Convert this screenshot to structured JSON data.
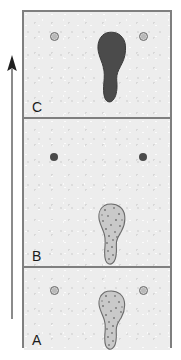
{
  "figure": {
    "background_color": "#ffffff",
    "plate_fill": "#ededed",
    "frame_color": "#7f7f7f",
    "width": 181,
    "height": 360
  },
  "arrow": {
    "name": "direction-arrow",
    "direction": "up",
    "color": "#4d4d4d",
    "label": ""
  },
  "panels": [
    {
      "id": "C",
      "label": "C",
      "order": 3,
      "position": "top",
      "marks": [
        {
          "type": "ring-spot",
          "label": "",
          "x_pct": 18,
          "y_pct": 19,
          "fill": "#b9b9b9",
          "stroke": "#6e6e6e"
        },
        {
          "type": "ring-spot",
          "label": "",
          "x_pct": 79,
          "y_pct": 19,
          "fill": "#b9b9b9",
          "stroke": "#6e6e6e"
        },
        {
          "type": "sole-dark",
          "label": "",
          "x_pct": 54,
          "y_pct": 55,
          "fill": "#4b4b4b",
          "stroke": "#3a3a3a"
        }
      ]
    },
    {
      "id": "B",
      "label": "B",
      "order": 2,
      "position": "middle",
      "marks": [
        {
          "type": "solid-spot",
          "label": "",
          "x_pct": 18,
          "y_pct": 23,
          "fill": "#4a4a4a",
          "stroke": ""
        },
        {
          "type": "solid-spot",
          "label": "",
          "x_pct": 79,
          "y_pct": 23,
          "fill": "#4a4a4a",
          "stroke": ""
        },
        {
          "type": "sole-speckle",
          "label": "",
          "x_pct": 54,
          "y_pct": 72,
          "fill": "#c9c9c9",
          "stroke": "#6b6b6b"
        }
      ]
    },
    {
      "id": "A",
      "label": "A",
      "order": 1,
      "position": "bottom",
      "marks": [
        {
          "type": "ring-spot",
          "label": "",
          "x_pct": 18,
          "y_pct": 22,
          "fill": "#b9b9b9",
          "stroke": "#6e6e6e"
        },
        {
          "type": "ring-spot",
          "label": "",
          "x_pct": 79,
          "y_pct": 22,
          "fill": "#b9b9b9",
          "stroke": "#6e6e6e"
        },
        {
          "type": "sole-speckle",
          "label": "",
          "x_pct": 54,
          "y_pct": 62,
          "fill": "#c9c9c9",
          "stroke": "#6b6b6b"
        }
      ]
    }
  ]
}
